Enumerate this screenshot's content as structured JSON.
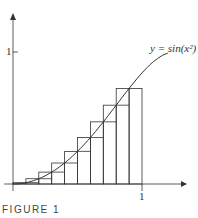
{
  "figure": {
    "caption": "FIGURE 1",
    "curve_label": "y = sin(x²)",
    "y_tick_label": "1",
    "x_tick_label": "1"
  },
  "chart_data": {
    "type": "line",
    "title": "",
    "function": "y = sin(x^2)",
    "x": [
      0,
      0.1,
      0.2,
      0.3,
      0.4,
      0.5,
      0.6,
      0.7,
      0.8,
      0.9,
      1.0,
      1.1,
      1.2
    ],
    "y": [
      0,
      0.01,
      0.04,
      0.09,
      0.159,
      0.247,
      0.352,
      0.471,
      0.597,
      0.724,
      0.841,
      0.935,
      0.991
    ],
    "rectangles": {
      "subinterval_width": 0.1,
      "left_edges": [
        0,
        0.1,
        0.2,
        0.3,
        0.4,
        0.5,
        0.6,
        0.7,
        0.8,
        0.9
      ],
      "upper_heights": [
        0.01,
        0.04,
        0.09,
        0.159,
        0.247,
        0.352,
        0.471,
        0.597,
        0.724,
        0.724
      ],
      "lower_heights": [
        0,
        0.01,
        0.04,
        0.09,
        0.159,
        0.247,
        0.352,
        0.471,
        0.597,
        0.724
      ]
    },
    "xlabel": "",
    "ylabel": "",
    "xticks": [
      "1"
    ],
    "yticks": [
      "1"
    ],
    "xlim": [
      0,
      1.25
    ],
    "ylim": [
      0,
      1.05
    ],
    "grid": false
  }
}
